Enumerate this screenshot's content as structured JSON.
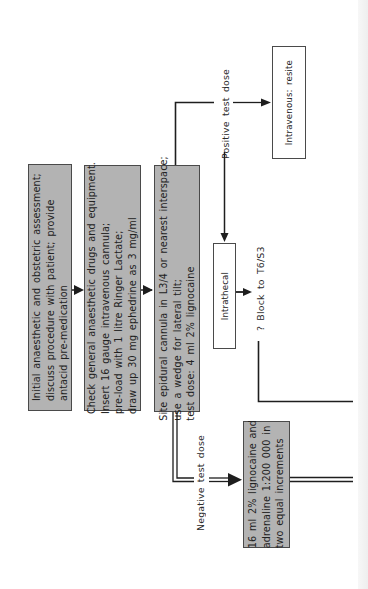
{
  "diagram": {
    "type": "flowchart",
    "orientation": "rotated-90-ccw",
    "colors": {
      "shaded_box": "#b3b3b3",
      "plain_box": "#ffffff",
      "stroke": "#1e1e1e",
      "text": "#222222"
    },
    "steps": [
      {
        "id": "initial-assessment",
        "text": "Initial anaesthetic and obstetric assessment;\ndiscuss procedure with patient; provide\nantacid pre-medication"
      },
      {
        "id": "check-drugs",
        "text": "Check general anaesthetic drugs and equipment.\nInsert 16 gauge intravenous cannula;\npre-load with 1 litre Ringer Lactate;\ndraw up 30 mg ephedrine as 3 mg/ml"
      },
      {
        "id": "site-epidural",
        "text": "Site epidural cannula in L3/4 or nearest interspace;\nuse a wedge for lateral tilt;\ntest dose: 4 ml 2% lignocaine"
      }
    ],
    "branches": {
      "positive": {
        "label": "Positive test dose",
        "intravenous": {
          "text": "Intravenous: resite"
        },
        "intrathecal": {
          "text": "Intrathecal"
        },
        "intrathecal_outcome": "? Block to T6/S3"
      },
      "negative": {
        "label": "Negative test dose",
        "next_step": {
          "text": "16 ml 2% lignocaine and\nadrenaline 1:200 000 in\ntwo equal increments"
        }
      }
    }
  }
}
